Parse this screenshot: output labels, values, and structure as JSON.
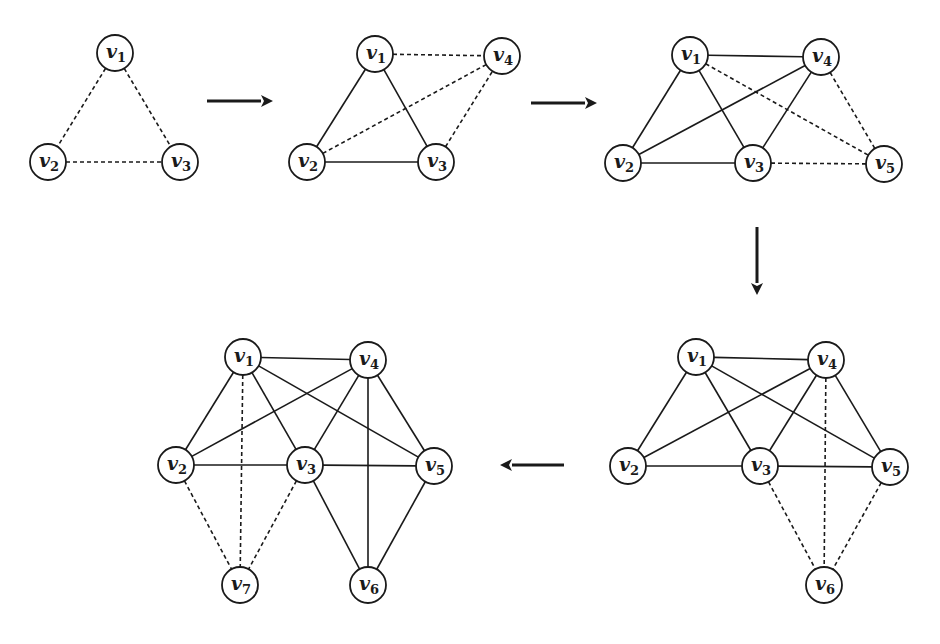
{
  "diagram": {
    "title": "",
    "colors": {
      "stroke": "#1a1a1a",
      "background": "#ffffff",
      "node_fill": "#ffffff"
    },
    "node_radius": 18,
    "graphs": [
      {
        "id": "step-1",
        "nodes": [
          {
            "id": "v1",
            "base": "v",
            "sub": "1",
            "x": 115,
            "y": 53
          },
          {
            "id": "v2",
            "base": "v",
            "sub": "2",
            "x": 48,
            "y": 162
          },
          {
            "id": "v3",
            "base": "v",
            "sub": "3",
            "x": 180,
            "y": 162
          }
        ],
        "edges": [
          {
            "from": "v1",
            "to": "v2",
            "style": "dashed"
          },
          {
            "from": "v1",
            "to": "v3",
            "style": "dashed"
          },
          {
            "from": "v2",
            "to": "v3",
            "style": "dashed"
          }
        ]
      },
      {
        "id": "step-2",
        "nodes": [
          {
            "id": "v1",
            "base": "v",
            "sub": "1",
            "x": 375,
            "y": 54
          },
          {
            "id": "v4",
            "base": "v",
            "sub": "4",
            "x": 502,
            "y": 56
          },
          {
            "id": "v2",
            "base": "v",
            "sub": "2",
            "x": 307,
            "y": 162
          },
          {
            "id": "v3",
            "base": "v",
            "sub": "3",
            "x": 436,
            "y": 162
          }
        ],
        "edges": [
          {
            "from": "v1",
            "to": "v2",
            "style": "solid"
          },
          {
            "from": "v1",
            "to": "v3",
            "style": "solid"
          },
          {
            "from": "v2",
            "to": "v3",
            "style": "solid"
          },
          {
            "from": "v1",
            "to": "v4",
            "style": "dashed"
          },
          {
            "from": "v2",
            "to": "v4",
            "style": "dashed"
          },
          {
            "from": "v3",
            "to": "v4",
            "style": "dashed"
          }
        ]
      },
      {
        "id": "step-3",
        "nodes": [
          {
            "id": "v1",
            "base": "v",
            "sub": "1",
            "x": 690,
            "y": 55
          },
          {
            "id": "v4",
            "base": "v",
            "sub": "4",
            "x": 821,
            "y": 57
          },
          {
            "id": "v2",
            "base": "v",
            "sub": "2",
            "x": 623,
            "y": 163
          },
          {
            "id": "v3",
            "base": "v",
            "sub": "3",
            "x": 753,
            "y": 163
          },
          {
            "id": "v5",
            "base": "v",
            "sub": "5",
            "x": 884,
            "y": 164
          }
        ],
        "edges": [
          {
            "from": "v1",
            "to": "v4",
            "style": "solid"
          },
          {
            "from": "v1",
            "to": "v2",
            "style": "solid"
          },
          {
            "from": "v1",
            "to": "v3",
            "style": "solid"
          },
          {
            "from": "v2",
            "to": "v4",
            "style": "solid"
          },
          {
            "from": "v2",
            "to": "v3",
            "style": "solid"
          },
          {
            "from": "v3",
            "to": "v4",
            "style": "solid"
          },
          {
            "from": "v1",
            "to": "v5",
            "style": "dashed"
          },
          {
            "from": "v4",
            "to": "v5",
            "style": "dashed"
          },
          {
            "from": "v3",
            "to": "v5",
            "style": "dashed"
          }
        ]
      },
      {
        "id": "step-4",
        "nodes": [
          {
            "id": "v1",
            "base": "v",
            "sub": "1",
            "x": 696,
            "y": 357
          },
          {
            "id": "v4",
            "base": "v",
            "sub": "4",
            "x": 826,
            "y": 360
          },
          {
            "id": "v2",
            "base": "v",
            "sub": "2",
            "x": 628,
            "y": 466
          },
          {
            "id": "v3",
            "base": "v",
            "sub": "3",
            "x": 760,
            "y": 466
          },
          {
            "id": "v5",
            "base": "v",
            "sub": "5",
            "x": 890,
            "y": 467
          },
          {
            "id": "v6",
            "base": "v",
            "sub": "6",
            "x": 824,
            "y": 585
          }
        ],
        "edges": [
          {
            "from": "v1",
            "to": "v4",
            "style": "solid"
          },
          {
            "from": "v1",
            "to": "v2",
            "style": "solid"
          },
          {
            "from": "v1",
            "to": "v3",
            "style": "solid"
          },
          {
            "from": "v1",
            "to": "v5",
            "style": "solid"
          },
          {
            "from": "v2",
            "to": "v4",
            "style": "solid"
          },
          {
            "from": "v2",
            "to": "v3",
            "style": "solid"
          },
          {
            "from": "v3",
            "to": "v4",
            "style": "solid"
          },
          {
            "from": "v3",
            "to": "v5",
            "style": "solid"
          },
          {
            "from": "v4",
            "to": "v5",
            "style": "solid"
          },
          {
            "from": "v3",
            "to": "v6",
            "style": "dashed"
          },
          {
            "from": "v4",
            "to": "v6",
            "style": "dashed"
          },
          {
            "from": "v5",
            "to": "v6",
            "style": "dashed"
          }
        ]
      },
      {
        "id": "step-5",
        "nodes": [
          {
            "id": "v1",
            "base": "v",
            "sub": "1",
            "x": 243,
            "y": 357
          },
          {
            "id": "v4",
            "base": "v",
            "sub": "4",
            "x": 368,
            "y": 360
          },
          {
            "id": "v2",
            "base": "v",
            "sub": "2",
            "x": 176,
            "y": 465
          },
          {
            "id": "v3",
            "base": "v",
            "sub": "3",
            "x": 305,
            "y": 465
          },
          {
            "id": "v5",
            "base": "v",
            "sub": "5",
            "x": 434,
            "y": 466
          },
          {
            "id": "v7",
            "base": "v",
            "sub": "7",
            "x": 240,
            "y": 585
          },
          {
            "id": "v6",
            "base": "v",
            "sub": "6",
            "x": 368,
            "y": 585
          }
        ],
        "edges": [
          {
            "from": "v1",
            "to": "v4",
            "style": "solid"
          },
          {
            "from": "v1",
            "to": "v2",
            "style": "solid"
          },
          {
            "from": "v1",
            "to": "v3",
            "style": "solid"
          },
          {
            "from": "v1",
            "to": "v5",
            "style": "solid"
          },
          {
            "from": "v2",
            "to": "v4",
            "style": "solid"
          },
          {
            "from": "v2",
            "to": "v3",
            "style": "solid"
          },
          {
            "from": "v3",
            "to": "v4",
            "style": "solid"
          },
          {
            "from": "v3",
            "to": "v5",
            "style": "solid"
          },
          {
            "from": "v4",
            "to": "v5",
            "style": "solid"
          },
          {
            "from": "v4",
            "to": "v6",
            "style": "solid"
          },
          {
            "from": "v3",
            "to": "v6",
            "style": "solid"
          },
          {
            "from": "v5",
            "to": "v6",
            "style": "solid"
          },
          {
            "from": "v1",
            "to": "v7",
            "style": "dashed"
          },
          {
            "from": "v2",
            "to": "v7",
            "style": "dashed"
          },
          {
            "from": "v3",
            "to": "v7",
            "style": "dashed"
          }
        ]
      }
    ],
    "arrows": [
      {
        "id": "arrow-1-to-2",
        "direction": "right",
        "x1": 207,
        "y1": 101,
        "x2": 273,
        "y2": 101
      },
      {
        "id": "arrow-2-to-3",
        "direction": "right",
        "x1": 531,
        "y1": 103,
        "x2": 597,
        "y2": 103
      },
      {
        "id": "arrow-3-to-4",
        "direction": "down",
        "x1": 757,
        "y1": 227,
        "x2": 757,
        "y2": 295
      },
      {
        "id": "arrow-4-to-5",
        "direction": "left",
        "x1": 564,
        "y1": 465,
        "x2": 500,
        "y2": 465
      }
    ]
  }
}
